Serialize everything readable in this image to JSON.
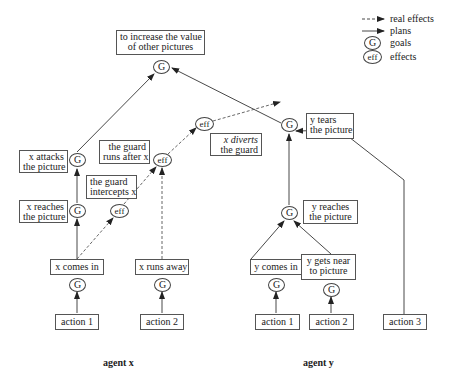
{
  "legend": {
    "items": [
      {
        "symbol": "dashed-arrow",
        "label": "real effects"
      },
      {
        "symbol": "solid-arrow",
        "label": "plans"
      },
      {
        "symbol": "G",
        "label": "goals"
      },
      {
        "symbol": "eff",
        "label": "effects"
      }
    ]
  },
  "nodes": {
    "goal_symbol": "G",
    "effect_symbol": "eff",
    "top_goal": {
      "line1": "to increase the value",
      "line2": "of other pictures"
    },
    "y_tears": {
      "line1": "y tears",
      "line2": "the picture"
    },
    "x_diverts": {
      "line1": "x diverts",
      "line2": "the guard"
    },
    "guard_runs": {
      "line1": "the guard",
      "line2": "runs after x"
    },
    "x_attacks": {
      "line1": "x attacks",
      "line2": "the picture"
    },
    "guard_intercepts": {
      "line1": "the guard",
      "line2": "intercepts x"
    },
    "x_reaches": {
      "line1": "x reaches",
      "line2": "the picture"
    },
    "x_comes_in": "x comes in",
    "x_runs_away": "x runs away",
    "y_reaches": {
      "line1": "y reaches",
      "line2": "the picture"
    },
    "y_comes_in": "y comes in",
    "y_gets_near": {
      "line1": "y gets near",
      "line2": "to picture"
    },
    "x_action1": "action 1",
    "x_action2": "action 2",
    "y_action1": "action 1",
    "y_action2": "action 2",
    "y_action3": "action 3"
  },
  "agents": {
    "x": "agent x",
    "y": "agent y"
  },
  "colors": {
    "line": "#333333",
    "dashed": "#555555",
    "border": "#555555",
    "background": "#ffffff"
  }
}
